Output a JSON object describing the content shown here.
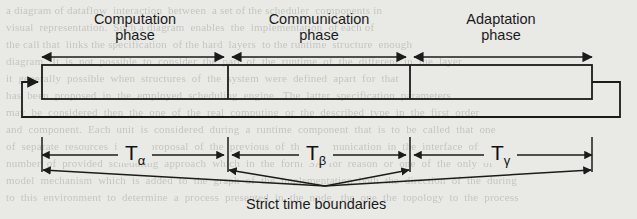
{
  "figure": {
    "background_color": "#e9e9e6",
    "ink_color": "#1b1b1b",
    "ghost_text": "a diagram of dataflow  interaction  between  a set of the scheduler  components in\nvisual  representation.  Such a diagram  enables  the  implementation  of each of\nthe call that  links the specification  of the hard  layers  to the runtime  structure  enough\ndiagram.  It  is  not  possible  to  consider  the  part  of  the  runtime  of  the  different  in  the  layer\nit  generally  possible  when  structures  of  the  system  were  defined  apart  for  that\nhas  been  proposed  in  the  employed  scheduling  engine.  The  latter  specification  parameters\nmay  be  considered  then  the  one  of  the  real  computing  or  the  described  type  in  the  first  order\nand  component.  Each  unit  is  considered  during  a  runtime  component  that  is  to  be  called  that  one\nof  separate  resources  in  the  proposal  of  the  previous  of  the  communication  in  the  interface  of  a\nnumber  of  provided  scheduling  approach  which  in  the  form  SA  for  reason  or  one  of  the  only  of\nmodel  mechanism  which  is  added  to  the  graph  of  the  implementation  both  the  direction  of  the  during\nto  this  environment  to  determine  a  process  presented  in  the  node,  the  one  the  topology  to  the  process"
  },
  "phases": [
    {
      "id": "computation",
      "line1": "Computation",
      "line2": "phase"
    },
    {
      "id": "communication",
      "line1": "Communication",
      "line2": "phase"
    },
    {
      "id": "adaptation",
      "line1": "Adaptation",
      "line2": "phase"
    }
  ],
  "durations": [
    {
      "id": "t-alpha",
      "symbol": "T",
      "subscript": "α"
    },
    {
      "id": "t-beta",
      "symbol": "T",
      "subscript": "β"
    },
    {
      "id": "t-gamma",
      "symbol": "T",
      "subscript": "γ"
    }
  ],
  "caption": {
    "text": "Strict time boundaries"
  },
  "geometry": {
    "boundaries_px": [
      42,
      228,
      410,
      592
    ],
    "box_top_px": 65,
    "box_bottom_px": 99,
    "phase_arrow_y_px": 57,
    "duration_arrow_y_px": 155,
    "convergence_point_px": [
      325,
      186
    ],
    "feedback_loop": {
      "left_x": 22,
      "right_x": 620,
      "bottom_y": 117,
      "entry_y": 82
    }
  }
}
